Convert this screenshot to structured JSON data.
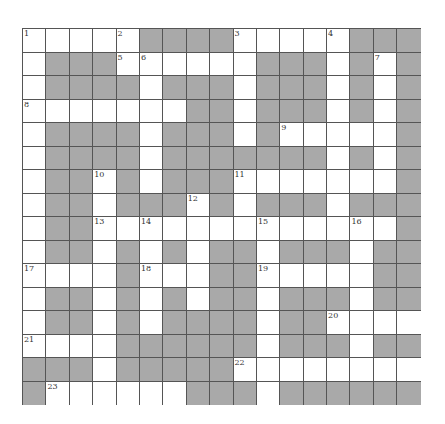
{
  "puzzle": {
    "columns": 17,
    "rows": 16,
    "colors": {
      "block": "#a9a9a9",
      "white": "#ffffff",
      "line": "#555555"
    },
    "grid": [
      [
        "1",
        ".",
        ".",
        ".",
        "2",
        "#",
        "#",
        "#",
        "#",
        "3",
        ".",
        ".",
        ".",
        "4",
        "#",
        "#",
        "#"
      ],
      [
        ".",
        "#",
        "#",
        "#",
        "5",
        "6",
        ".",
        ".",
        ".",
        ".",
        "#",
        "#",
        "#",
        ".",
        "#",
        "7",
        "#"
      ],
      [
        ".",
        "#",
        "#",
        "#",
        "#",
        ".",
        "#",
        "#",
        "#",
        ".",
        "#",
        "#",
        "#",
        ".",
        "#",
        ".",
        "#"
      ],
      [
        "8",
        ".",
        ".",
        ".",
        ".",
        ".",
        ".",
        "#",
        "#",
        ".",
        "#",
        "#",
        "#",
        ".",
        "#",
        ".",
        "#"
      ],
      [
        ".",
        "#",
        "#",
        "#",
        "#",
        ".",
        "#",
        "#",
        "#",
        ".",
        "#",
        "9",
        ".",
        ".",
        ".",
        ".",
        "#"
      ],
      [
        ".",
        "#",
        "#",
        "#",
        "#",
        ".",
        "#",
        "#",
        "#",
        "#",
        "#",
        "#",
        "#",
        ".",
        "#",
        ".",
        "#"
      ],
      [
        ".",
        "#",
        "#",
        "10",
        "#",
        ".",
        "#",
        "#",
        "#",
        "11",
        ".",
        ".",
        ".",
        ".",
        ".",
        ".",
        "#"
      ],
      [
        ".",
        "#",
        "#",
        ".",
        "#",
        "#",
        "#",
        "12",
        "#",
        ".",
        "#",
        "#",
        "#",
        ".",
        "#",
        "#",
        "#"
      ],
      [
        ".",
        "#",
        "#",
        "13",
        ".",
        "14",
        ".",
        ".",
        ".",
        ".",
        "15",
        ".",
        ".",
        ".",
        "16",
        ".",
        "#"
      ],
      [
        ".",
        "#",
        "#",
        ".",
        "#",
        ".",
        "#",
        ".",
        "#",
        "#",
        ".",
        "#",
        "#",
        "#",
        ".",
        "#",
        "#"
      ],
      [
        "17",
        ".",
        ".",
        ".",
        "#",
        "18",
        ".",
        ".",
        "#",
        "#",
        "19",
        ".",
        ".",
        ".",
        ".",
        "#",
        "#"
      ],
      [
        ".",
        "#",
        "#",
        ".",
        "#",
        ".",
        "#",
        ".",
        "#",
        "#",
        ".",
        "#",
        "#",
        "#",
        ".",
        "#",
        "#"
      ],
      [
        ".",
        "#",
        "#",
        ".",
        "#",
        ".",
        "#",
        "#",
        "#",
        "#",
        ".",
        "#",
        "#",
        "20",
        ".",
        ".",
        "."
      ],
      [
        "21",
        ".",
        ".",
        ".",
        "#",
        "#",
        "#",
        "#",
        "#",
        "#",
        ".",
        "#",
        "#",
        "#",
        ".",
        "#",
        "#"
      ],
      [
        "#",
        "#",
        "#",
        ".",
        "#",
        "#",
        "#",
        "#",
        "#",
        "22",
        ".",
        ".",
        ".",
        ".",
        ".",
        ".",
        "."
      ],
      [
        "#",
        "23",
        ".",
        ".",
        ".",
        ".",
        ".",
        "#",
        "#",
        "#",
        ".",
        "#",
        "#",
        "#",
        "#",
        "#",
        "#"
      ]
    ]
  }
}
